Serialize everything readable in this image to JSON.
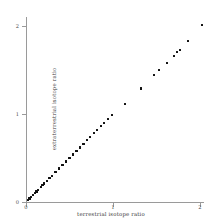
{
  "chart_data": {
    "type": "scatter",
    "title": "",
    "xlabel": "terrestrial isotope ratio",
    "ylabel": "extraterrestrial isotope ratio",
    "xlim": [
      -0.05,
      2.15
    ],
    "ylim": [
      -0.05,
      2.15
    ],
    "xticks": [
      0,
      1,
      2
    ],
    "yticks": [
      0,
      1,
      2
    ],
    "xticklabels": [
      "0",
      "1",
      "2"
    ],
    "yticklabels": [
      "0",
      "1",
      "2"
    ],
    "grid": false,
    "legend": null,
    "marker": "square",
    "marker_color": "#111111",
    "series": [
      {
        "name": "isotope ratio pairs",
        "x": [
          0.02,
          0.04,
          0.06,
          0.08,
          0.1,
          0.12,
          0.14,
          0.17,
          0.19,
          0.21,
          0.24,
          0.27,
          0.3,
          0.34,
          0.38,
          0.42,
          0.46,
          0.5,
          0.54,
          0.58,
          0.62,
          0.66,
          0.7,
          0.74,
          0.78,
          0.82,
          0.86,
          0.9,
          0.94,
          0.99,
          1.14,
          1.32,
          1.47,
          1.53,
          1.62,
          1.7,
          1.74,
          1.77,
          1.86,
          2.02
        ],
        "y": [
          0.02,
          0.04,
          0.06,
          0.08,
          0.1,
          0.12,
          0.14,
          0.17,
          0.19,
          0.21,
          0.24,
          0.27,
          0.3,
          0.34,
          0.38,
          0.42,
          0.46,
          0.5,
          0.54,
          0.58,
          0.62,
          0.66,
          0.7,
          0.74,
          0.78,
          0.82,
          0.86,
          0.9,
          0.94,
          0.99,
          1.11,
          1.29,
          1.44,
          1.5,
          1.58,
          1.66,
          1.7,
          1.73,
          1.83,
          2.01
        ]
      }
    ]
  },
  "axes": {
    "x_tick_labels": [
      "0",
      "1",
      "2"
    ],
    "y_tick_labels": [
      "0",
      "1",
      "2"
    ],
    "x_title": "terrestrial isotope ratio",
    "y_title": "extraterrestrial isotope ratio"
  }
}
